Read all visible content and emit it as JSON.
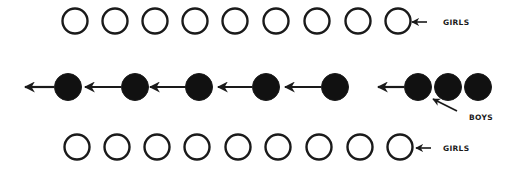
{
  "diagram": {
    "type": "formation-diagram",
    "colors": {
      "stroke": "#1a1a1a",
      "fill_boy": "#111111",
      "fill_girl": "#ffffff",
      "background": "#ffffff"
    },
    "rows": [
      {
        "id": "top-girls",
        "label": "GIRLS",
        "kind": "girl",
        "cy": 21,
        "r": 12.5,
        "circles_cx": [
          75,
          115,
          155,
          195,
          235,
          276,
          317,
          358,
          398
        ],
        "label_arrow": {
          "x1": 427,
          "y1": 22,
          "x2": 412,
          "y2": 22
        },
        "label_pos": {
          "x": 443,
          "y": 25
        }
      },
      {
        "id": "middle-boys",
        "label": "BOYS",
        "kind": "boy",
        "cy": 87,
        "r": 13.5,
        "circles_cx": [
          68,
          135,
          199,
          266,
          335,
          418,
          448,
          478
        ],
        "motion_arrows": [
          {
            "x1": 54,
            "x2": 25
          },
          {
            "x1": 121,
            "x2": 85
          },
          {
            "x1": 186,
            "x2": 150
          },
          {
            "x1": 252,
            "x2": 218
          },
          {
            "x1": 321,
            "x2": 285
          },
          {
            "x1": 404,
            "x2": 378
          }
        ],
        "label_arrow": {
          "x1": 457,
          "y1": 111,
          "x2": 433,
          "y2": 99
        },
        "label_pos": {
          "x": 469,
          "y": 120
        }
      },
      {
        "id": "bottom-girls",
        "label": "GIRLS",
        "kind": "girl",
        "cy": 147,
        "r": 12.5,
        "circles_cx": [
          77,
          117,
          157,
          197,
          238,
          278,
          319,
          360,
          400
        ],
        "label_arrow": {
          "x1": 431,
          "y1": 148,
          "x2": 416,
          "y2": 148
        },
        "label_pos": {
          "x": 443,
          "y": 151
        }
      }
    ]
  }
}
